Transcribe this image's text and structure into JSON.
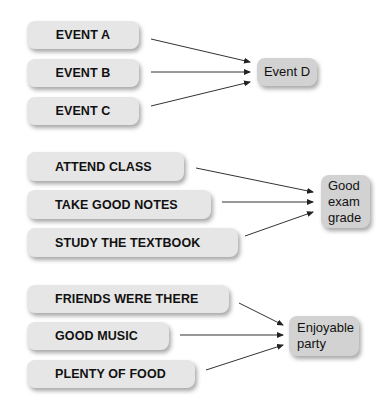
{
  "groups": [
    {
      "causes": [
        "EVENT A",
        "EVENT B",
        "EVENT C"
      ],
      "effect": "Event D"
    },
    {
      "causes": [
        "ATTEND CLASS",
        "TAKE GOOD NOTES",
        "STUDY THE TEXTBOOK"
      ],
      "effect_lines": [
        "Good",
        "exam",
        "grade"
      ]
    },
    {
      "causes": [
        "FRIENDS WERE THERE",
        "GOOD MUSIC",
        "PLENTY OF FOOD"
      ],
      "effect_lines": [
        "Enjoyable",
        "party"
      ]
    }
  ],
  "colors": {
    "cause_box": "#e6e6e6",
    "effect_box": "#d2d2d2",
    "arrow": "#222222"
  }
}
